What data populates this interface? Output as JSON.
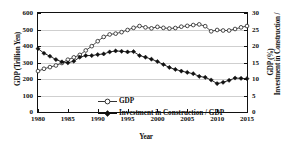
{
  "chart_data": {
    "type": "line",
    "title": "",
    "xlabel": "Year",
    "ylabel": "GDP (Trillion Yen)",
    "ylabel_right": "Investment in Construction / GDP (%)",
    "xlim": [
      1980,
      2015
    ],
    "ylim": [
      0,
      600
    ],
    "ylim_right": [
      0,
      30
    ],
    "grid": true,
    "legend_position": "inside-lower-left",
    "x": [
      1980,
      1981,
      1982,
      1983,
      1984,
      1985,
      1986,
      1987,
      1988,
      1989,
      1990,
      1991,
      1992,
      1993,
      1994,
      1995,
      1996,
      1997,
      1998,
      1999,
      2000,
      2001,
      2002,
      2003,
      2004,
      2005,
      2006,
      2007,
      2008,
      2009,
      2010,
      2011,
      2012,
      2013,
      2014,
      2015
    ],
    "xticks": [
      1980,
      1985,
      1990,
      1995,
      2000,
      2005,
      2010,
      2015
    ],
    "yticks_left": [
      0,
      100,
      200,
      300,
      400,
      500,
      600
    ],
    "yticks_right": [
      0,
      5,
      10,
      15,
      20,
      25,
      30
    ],
    "series": [
      {
        "name": "GDP",
        "axis": "left",
        "marker": "open-circle",
        "unit": "Trillion Yen",
        "values": [
          248,
          262,
          272,
          282,
          297,
          317,
          331,
          346,
          373,
          399,
          429,
          455,
          470,
          475,
          484,
          497,
          510,
          521,
          513,
          507,
          516,
          510,
          506,
          509,
          517,
          522,
          527,
          531,
          520,
          489,
          497,
          494,
          494,
          503,
          513,
          521
        ]
      },
      {
        "name": "Investment in Construction / GDP",
        "axis": "right",
        "marker": "filled-diamond",
        "unit": "%",
        "values": [
          19.2,
          17.8,
          16.9,
          15.9,
          15.2,
          14.9,
          15.4,
          16.6,
          17.1,
          17.1,
          17.4,
          17.6,
          18.2,
          18.5,
          18.4,
          18.2,
          18.3,
          17.1,
          16.6,
          16.0,
          15.3,
          14.4,
          13.5,
          12.9,
          12.4,
          12.0,
          11.6,
          10.8,
          10.5,
          9.7,
          8.6,
          9.0,
          9.6,
          10.3,
          10.2,
          10.1
        ]
      }
    ]
  },
  "axes": {
    "left_title": "GDP (Trillion Yen)",
    "right_title_line1": "Investment in Construction /",
    "right_title_line2": "GDP (%)",
    "x_title": "Year"
  },
  "legend": {
    "gdp_label": "GDP",
    "investment_label": "Investment in Construction / GDP"
  },
  "colors": {
    "axis": "#111111",
    "grid": "#cfcfcf",
    "series_gdp": "#333333",
    "series_investment": "#111111",
    "background": "#ffffff"
  }
}
